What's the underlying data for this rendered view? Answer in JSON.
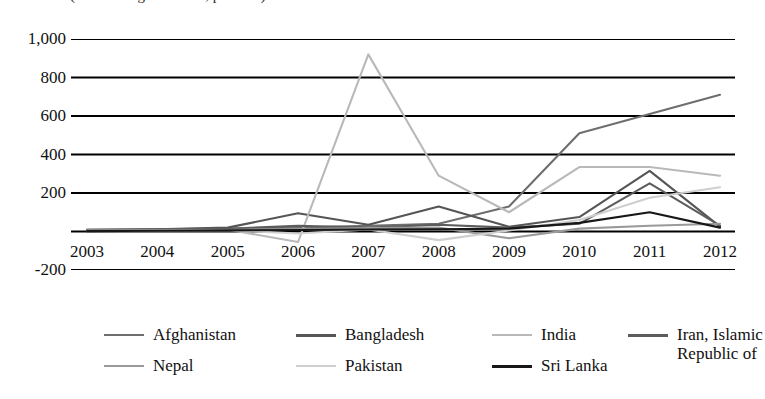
{
  "chart": {
    "title_partial": "(share in regional total, per cent)",
    "type": "line"
  },
  "yaxis": {
    "ticks": [
      "1,000",
      "800",
      "600",
      "400",
      "200",
      "",
      "-200"
    ]
  },
  "xaxis": {
    "ticks": [
      "2003",
      "2004",
      "2005",
      "2006",
      "2007",
      "2008",
      "2009",
      "2010",
      "2011",
      "2012"
    ]
  },
  "legend": {
    "items": [
      {
        "label": "Afghanistan",
        "color": "#6e6e6e"
      },
      {
        "label": "Bangladesh",
        "color": "#555555"
      },
      {
        "label": "India",
        "color": "#b9b9b9"
      },
      {
        "label": "Iran, Islamic Republic of",
        "color": "#5c5c5c"
      },
      {
        "label": "Nepal",
        "color": "#9a9a9a"
      },
      {
        "label": "Pakistan",
        "color": "#cfcfcf"
      },
      {
        "label": "Sri Lanka",
        "color": "#171717"
      }
    ]
  },
  "chart_data": {
    "type": "line",
    "title": "(share in regional total, per cent)",
    "xlabel": "",
    "ylabel": "",
    "x": [
      2003,
      2004,
      2005,
      2006,
      2007,
      2008,
      2009,
      2010,
      2011,
      2012
    ],
    "categories": [
      "2003",
      "2004",
      "2005",
      "2006",
      "2007",
      "2008",
      "2009",
      "2010",
      "2011",
      "2012"
    ],
    "ylim": [
      -200,
      1000
    ],
    "ytick_values": [
      -200,
      0,
      200,
      400,
      600,
      800,
      1000
    ],
    "grid": true,
    "legend_position": "bottom",
    "series": [
      {
        "name": "Afghanistan",
        "color": "#6e6e6e",
        "values": [
          10,
          12,
          15,
          20,
          30,
          40,
          130,
          510,
          610,
          710
        ]
      },
      {
        "name": "Bangladesh",
        "color": "#555555",
        "values": [
          8,
          12,
          20,
          95,
          35,
          130,
          25,
          75,
          315,
          25
        ]
      },
      {
        "name": "India",
        "color": "#b9b9b9",
        "values": [
          5,
          8,
          10,
          -55,
          920,
          290,
          100,
          335,
          335,
          290
        ]
      },
      {
        "name": "Iran, Islamic Republic of",
        "color": "#5c5c5c",
        "values": [
          6,
          9,
          14,
          30,
          20,
          35,
          20,
          40,
          250,
          30
        ]
      },
      {
        "name": "Nepal",
        "color": "#9a9a9a",
        "values": [
          4,
          6,
          8,
          12,
          18,
          20,
          -35,
          15,
          30,
          40
        ]
      },
      {
        "name": "Pakistan",
        "color": "#cfcfcf",
        "values": [
          3,
          5,
          7,
          -10,
          10,
          -45,
          5,
          60,
          175,
          230
        ]
      },
      {
        "name": "Sri Lanka",
        "color": "#171717",
        "values": [
          2,
          4,
          6,
          8,
          10,
          12,
          15,
          45,
          100,
          20
        ]
      }
    ]
  }
}
